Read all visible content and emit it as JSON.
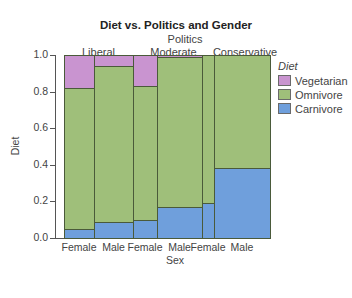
{
  "chart_data": {
    "type": "mosaic",
    "title": "Diet vs. Politics and Gender",
    "top_axis_label": "Politics",
    "top_categories": [
      "Liberal",
      "Moderate",
      "Conservative"
    ],
    "xlabel": "Sex",
    "ylabel": "Diet",
    "ylim": [
      0,
      1
    ],
    "yticks": [
      "0.0",
      "0.2",
      "0.4",
      "0.6",
      "0.8",
      "1.0"
    ],
    "legend": {
      "title": "Diet",
      "position": "right",
      "entries": [
        {
          "name": "Vegetarian",
          "color": "#c994d0"
        },
        {
          "name": "Omnivore",
          "color": "#9fbf7a"
        },
        {
          "name": "Carnivore",
          "color": "#6f9fdc"
        }
      ]
    },
    "columns": [
      {
        "politics": "Liberal",
        "sex": "Female",
        "width_fraction": 0.146,
        "carnivore": 0.05,
        "omnivore": 0.77,
        "vegetarian": 0.18
      },
      {
        "politics": "Liberal",
        "sex": "Male",
        "width_fraction": 0.189,
        "carnivore": 0.09,
        "omnivore": 0.85,
        "vegetarian": 0.06
      },
      {
        "politics": "Moderate",
        "sex": "Female",
        "width_fraction": 0.117,
        "carnivore": 0.1,
        "omnivore": 0.73,
        "vegetarian": 0.17
      },
      {
        "politics": "Moderate",
        "sex": "Male",
        "width_fraction": 0.218,
        "carnivore": 0.17,
        "omnivore": 0.82,
        "vegetarian": 0.01
      },
      {
        "politics": "Conservative",
        "sex": "Female",
        "width_fraction": 0.058,
        "carnivore": 0.19,
        "omnivore": 0.81,
        "vegetarian": 0.0
      },
      {
        "politics": "Conservative",
        "sex": "Male",
        "width_fraction": 0.272,
        "carnivore": 0.38,
        "omnivore": 0.62,
        "vegetarian": 0.0
      }
    ]
  }
}
